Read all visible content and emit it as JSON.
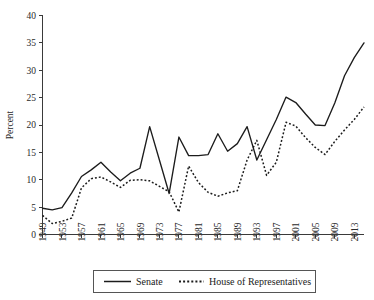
{
  "chart_data": {
    "type": "line",
    "title": "",
    "subtitle": "",
    "xlabel": "",
    "ylabel": "Percent",
    "ylim": [
      0,
      40
    ],
    "yticks": [
      0,
      5,
      10,
      15,
      20,
      25,
      30,
      35,
      40
    ],
    "xlim": [
      1949,
      2015
    ],
    "xticks": [
      1949,
      1953,
      1957,
      1961,
      1965,
      1969,
      1973,
      1977,
      1981,
      1985,
      1989,
      1993,
      1997,
      2001,
      2005,
      2009,
      2013
    ],
    "xtick_labels": [
      "1949",
      "1953",
      "1957",
      "1961",
      "1965",
      "1969",
      "1973",
      "1977",
      "1981",
      "1985",
      "1989",
      "1993",
      "1997",
      "2001",
      "2005",
      "2009",
      "2013"
    ],
    "grid": false,
    "legend_position": "bottom",
    "x": [
      1949,
      1951,
      1953,
      1955,
      1957,
      1959,
      1961,
      1963,
      1965,
      1967,
      1969,
      1971,
      1973,
      1975,
      1977,
      1979,
      1981,
      1983,
      1985,
      1987,
      1989,
      1991,
      1993,
      1995,
      1997,
      1999,
      2001,
      2003,
      2005,
      2007,
      2009,
      2011,
      2013,
      2015
    ],
    "series": [
      {
        "name": "Senate",
        "style": "solid",
        "color": "#1c1c1c",
        "values": [
          4.8,
          4.5,
          4.9,
          7.6,
          10.6,
          11.8,
          13.2,
          11.4,
          9.8,
          11.2,
          12.1,
          19.7,
          13.6,
          7.5,
          17.8,
          14.4,
          14.4,
          14.6,
          18.4,
          15.2,
          16.6,
          19.7,
          13.6,
          17.3,
          21.0,
          25.1,
          24.1,
          22.0,
          20.0,
          19.9,
          24.0,
          29.0,
          32.3,
          35.0
        ]
      },
      {
        "name": "House of Representatives",
        "style": "dotted",
        "color": "#1c1c1c",
        "values": [
          3.5,
          2.0,
          2.4,
          3.0,
          8.5,
          10.2,
          10.5,
          9.6,
          8.6,
          9.9,
          10.0,
          9.8,
          8.8,
          7.8,
          4.1,
          12.5,
          9.5,
          7.7,
          7.0,
          7.6,
          8.0,
          13.6,
          17.2,
          10.8,
          13.2,
          20.5,
          19.8,
          17.7,
          15.9,
          14.6,
          17.0,
          19.1,
          21.0,
          23.3
        ]
      }
    ],
    "legend": [
      {
        "label": "Senate",
        "style": "solid"
      },
      {
        "label": "House of Representatives",
        "style": "dotted"
      }
    ]
  }
}
